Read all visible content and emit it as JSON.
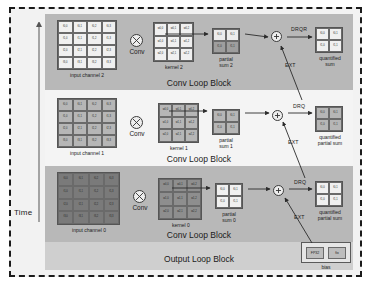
{
  "figure": {
    "time_axis_label": "Time",
    "output_block_label": "Output Loop Block",
    "conv_block_label": "Conv Loop Block",
    "caption": ""
  },
  "operators": {
    "conv_label": "Conv",
    "conv_symbol": "circle-times-icon",
    "add_symbol": "circle-plus-icon"
  },
  "edges": {
    "drqr": "DRQR",
    "drq": "DRQ",
    "ext": "EXT"
  },
  "bias": {
    "caption": "bias",
    "cells": [
      "FP32",
      "fix"
    ]
  },
  "rows": [
    {
      "id": "row-2",
      "shaded": true,
      "input": {
        "caption": "input channel 2",
        "rows": 4,
        "cols": 4,
        "tone": "tone-light",
        "cells": [
          "f0,0",
          "f0,1",
          "f0,2",
          "f0,3",
          "f1,0",
          "f1,1",
          "f1,2",
          "f1,3",
          "f2,0",
          "f2,1",
          "f2,2",
          "f2,3",
          "f3,0",
          "f3,1",
          "f3,2",
          "f3,3"
        ]
      },
      "kernel": {
        "caption": "kernel 2",
        "rows": 3,
        "cols": 3,
        "tone": "tone-light",
        "cells": [
          "w0,0",
          "w0,1",
          "w0,2",
          "w1,0",
          "w1,1",
          "w1,2",
          "w2,0",
          "w2,1",
          "w2,2"
        ]
      },
      "psum": {
        "caption": "partial\nsum 2",
        "rows": 2,
        "cols": 2,
        "tone": "tone-mix",
        "cells": [
          "f0,0",
          "f0,1",
          "f1,0",
          "f1,1"
        ]
      },
      "quant": {
        "caption": "quantified\nsum",
        "rows": 2,
        "cols": 2,
        "tone": "tone-light",
        "cells": [
          "f0,0",
          "f0,1",
          "f1,0",
          "f1,1"
        ]
      },
      "out_edge_label": "DRQR",
      "ext_label": "EXT"
    },
    {
      "id": "row-1",
      "shaded": false,
      "input": {
        "caption": "input channel 1",
        "rows": 4,
        "cols": 4,
        "tone": "tone-mid",
        "cells": [
          "f0,0",
          "f0,1",
          "f0,2",
          "f0,3",
          "f1,0",
          "f1,1",
          "f1,2",
          "f1,3",
          "f2,0",
          "f2,1",
          "f2,2",
          "f2,3",
          "f3,0",
          "f3,1",
          "f3,2",
          "f3,3"
        ]
      },
      "kernel": {
        "caption": "kernel 1",
        "rows": 3,
        "cols": 3,
        "tone": "tone-mid",
        "cells": [
          "w0,0",
          "w0,1",
          "w0,2",
          "w1,0",
          "w1,1",
          "w1,2",
          "w2,0",
          "w2,1",
          "w2,2"
        ]
      },
      "psum": {
        "caption": "partial\nsum 1",
        "rows": 2,
        "cols": 2,
        "tone": "tone-mid",
        "cells": [
          "f0,0",
          "f0,1",
          "f1,0",
          "f1,1"
        ]
      },
      "quant": {
        "caption": "quantified\npartial sum",
        "rows": 2,
        "cols": 2,
        "tone": "tone-mid",
        "cells": [
          "f0,0",
          "f0,1",
          "f1,0",
          "f1,1"
        ]
      },
      "out_edge_label": "DRQ",
      "ext_label": "EXT"
    },
    {
      "id": "row-0",
      "shaded": true,
      "input": {
        "caption": "input channel 0",
        "rows": 4,
        "cols": 4,
        "tone": "tone-darker",
        "cells": [
          "f0,0",
          "f0,1",
          "f0,2",
          "f0,3",
          "f1,0",
          "f1,1",
          "f1,2",
          "f1,3",
          "f2,0",
          "f2,1",
          "f2,2",
          "f2,3",
          "f3,0",
          "f3,1",
          "f3,2",
          "f3,3"
        ]
      },
      "kernel": {
        "caption": "kernel 0",
        "rows": 3,
        "cols": 3,
        "tone": "tone-dark",
        "cells": [
          "w0,0",
          "w0,1",
          "w0,2",
          "w1,0",
          "w1,1",
          "w1,2",
          "w2,0",
          "w2,1",
          "w2,2"
        ]
      },
      "psum": {
        "caption": "partial\nsum 0",
        "rows": 2,
        "cols": 2,
        "tone": "tone-light",
        "cells": [
          "f0,0",
          "f0,1",
          "f1,0",
          "f1,1"
        ]
      },
      "quant": {
        "caption": "quantified\npartial sum",
        "rows": 2,
        "cols": 2,
        "tone": "tone-light",
        "cells": [
          "f0,0",
          "f0,1",
          "f1,0",
          "f1,1"
        ]
      },
      "out_edge_label": "DRQ",
      "ext_label": "EXT"
    }
  ]
}
